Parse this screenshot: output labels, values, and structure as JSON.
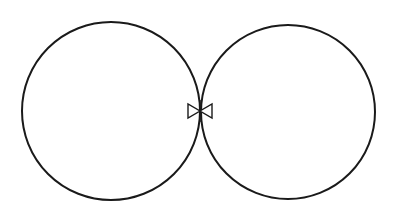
{
  "figure": {
    "canvas": {
      "width": 397,
      "height": 216,
      "background_color": "#ffffff"
    },
    "style": {
      "stroke_color": "#1a1a1a",
      "stroke_width": 2.0,
      "fill_color": "#ffffff",
      "bowtie_stroke_width": 1.4
    },
    "shapes": [
      {
        "name": "left-circle",
        "type": "circle",
        "cx": 111,
        "cy": 111,
        "r": 89,
        "stroke_width": 2.0
      },
      {
        "name": "right-circle",
        "type": "circle",
        "cx": 288,
        "cy": 112,
        "r": 87,
        "stroke_width": 2.0
      },
      {
        "name": "bowtie-left-triangle",
        "type": "triangle",
        "points": "188,104 188,118 200,111",
        "stroke_width": 1.4
      },
      {
        "name": "bowtie-right-triangle",
        "type": "triangle",
        "points": "212,104 212,118 200,111",
        "stroke_width": 1.4
      },
      {
        "name": "bowtie-center-stem",
        "type": "line",
        "x1": 200,
        "y1": 100,
        "x2": 200,
        "y2": 122,
        "stroke_width": 1.4
      }
    ]
  }
}
